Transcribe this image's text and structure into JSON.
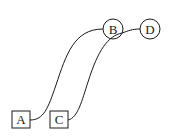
{
  "diagram": {
    "nodes": [
      {
        "id": "A",
        "label": "A",
        "shape": "box",
        "x": 12,
        "y": 111,
        "w": 18,
        "h": 17
      },
      {
        "id": "C",
        "label": "C",
        "shape": "box",
        "x": 50,
        "y": 111,
        "w": 18,
        "h": 17
      },
      {
        "id": "B",
        "label": "B",
        "shape": "circle",
        "cx": 113,
        "cy": 29,
        "r": 10
      },
      {
        "id": "D",
        "label": "D",
        "shape": "circle",
        "cx": 150,
        "cy": 29,
        "r": 10
      }
    ],
    "edges": [
      {
        "from": "A",
        "to": "B"
      },
      {
        "from": "C",
        "to": "D"
      }
    ],
    "colors": {
      "stroke": "#1a1a1a",
      "background": "#ffffff"
    }
  }
}
